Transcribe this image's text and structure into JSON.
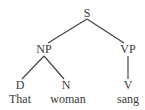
{
  "tree": {
    "nodes": [
      {
        "id": "S",
        "label": "S",
        "x": 87,
        "y": 7
      },
      {
        "id": "NP",
        "label": "NP",
        "x": 44,
        "y": 43
      },
      {
        "id": "VP",
        "label": "VP",
        "x": 128,
        "y": 43
      },
      {
        "id": "D",
        "label": "D",
        "x": 20,
        "y": 79
      },
      {
        "id": "N",
        "label": "N",
        "x": 66,
        "y": 79
      },
      {
        "id": "V",
        "label": "V",
        "x": 128,
        "y": 79
      },
      {
        "id": "w1",
        "label": "That",
        "x": 20,
        "y": 93
      },
      {
        "id": "w2",
        "label": "woman",
        "x": 68,
        "y": 93
      },
      {
        "id": "w3",
        "label": "sang",
        "x": 128,
        "y": 93
      }
    ],
    "edges": [
      {
        "from": "S",
        "to": "NP",
        "x1": 87,
        "y1": 19,
        "x2": 48,
        "y2": 43
      },
      {
        "from": "S",
        "to": "VP",
        "x1": 87,
        "y1": 19,
        "x2": 124,
        "y2": 43
      },
      {
        "from": "NP",
        "to": "D",
        "x1": 44,
        "y1": 56,
        "x2": 22,
        "y2": 79
      },
      {
        "from": "NP",
        "to": "N",
        "x1": 44,
        "y1": 56,
        "x2": 64,
        "y2": 79
      },
      {
        "from": "VP",
        "to": "V",
        "x1": 128,
        "y1": 56,
        "x2": 128,
        "y2": 79
      }
    ],
    "line_color": "#444444",
    "text_color": "#3a3a3a"
  }
}
